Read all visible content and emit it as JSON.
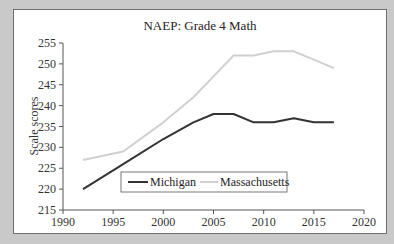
{
  "chart_data": {
    "type": "line",
    "title": "NAEP: Grade 4 Math",
    "xlabel": "",
    "ylabel": "Scale scores",
    "xlim": [
      1990,
      2020
    ],
    "ylim": [
      215,
      255
    ],
    "x_ticks": [
      1990,
      1995,
      2000,
      2005,
      2010,
      2015,
      2020
    ],
    "y_ticks": [
      215,
      220,
      225,
      230,
      235,
      240,
      245,
      250,
      255
    ],
    "grid": false,
    "legend_position": "bottom-inside",
    "x": [
      1992,
      1996,
      2000,
      2003,
      2005,
      2007,
      2009,
      2011,
      2013,
      2015,
      2017
    ],
    "series": [
      {
        "name": "Michigan",
        "color": "#333333",
        "values": [
          220,
          226,
          232,
          236,
          238,
          238,
          236,
          236,
          237,
          236,
          236
        ]
      },
      {
        "name": "Massachusetts",
        "color": "#d0d0d0",
        "values": [
          227,
          229,
          236,
          242,
          247,
          252,
          252,
          253,
          253,
          251,
          249
        ]
      }
    ]
  },
  "colors": {
    "background": "#c9c9c9",
    "plot_background": "#ffffff",
    "axis": "#555555"
  }
}
